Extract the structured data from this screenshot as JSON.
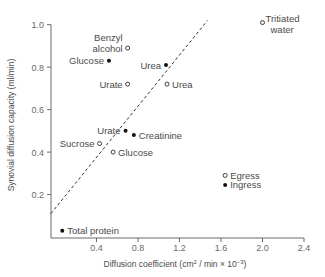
{
  "chart_data": {
    "type": "scatter",
    "title": "",
    "xlabel": "Diffusion coefficient (cm² / min × 10⁻³)",
    "ylabel": "Synovial diffusion capacity (ml/min)",
    "xlim": [
      0,
      2.4
    ],
    "ylim": [
      0,
      1.0
    ],
    "xticks": [
      0.4,
      0.8,
      1.2,
      1.6,
      2.0,
      2.4
    ],
    "xtick_labels": [
      "0.4",
      "0.8",
      "1.2",
      "1.6",
      "2.0",
      "2.4"
    ],
    "yticks": [
      0.2,
      0.4,
      0.6,
      0.8,
      1.0
    ],
    "ytick_labels": [
      "0.2",
      "0.4",
      "0.6",
      "0.8",
      "1.0"
    ],
    "grid": false,
    "legend": null,
    "series": [
      {
        "name": "Filled (solid) markers",
        "marker": "filled-circle",
        "points": [
          {
            "label": "Glucose",
            "x": 0.52,
            "y": 0.83,
            "label_side": "left"
          },
          {
            "label": "Urea",
            "x": 1.07,
            "y": 0.81,
            "label_side": "left"
          },
          {
            "label": "Urate",
            "x": 0.68,
            "y": 0.5,
            "label_side": "left"
          },
          {
            "label": "Creatinine",
            "x": 0.76,
            "y": 0.48,
            "label_side": "right"
          },
          {
            "label": "Ingress",
            "x": 1.64,
            "y": 0.245,
            "label_side": "right"
          },
          {
            "label": "Total protein",
            "x": 0.07,
            "y": 0.03,
            "label_side": "right"
          }
        ]
      },
      {
        "name": "Open (hollow) markers",
        "marker": "open-circle",
        "points": [
          {
            "label": "Benzyl alcohol",
            "label_lines": [
              "Benzyl",
              "alcohol"
            ],
            "x": 0.7,
            "y": 0.89,
            "label_side": "left"
          },
          {
            "label": "Urate",
            "x": 0.7,
            "y": 0.72,
            "label_side": "left"
          },
          {
            "label": "Urea",
            "x": 1.08,
            "y": 0.72,
            "label_side": "right"
          },
          {
            "label": "Sucrose",
            "x": 0.43,
            "y": 0.44,
            "label_side": "left"
          },
          {
            "label": "Glucose",
            "x": 0.56,
            "y": 0.4,
            "label_side": "right"
          },
          {
            "label": "Egress",
            "x": 1.64,
            "y": 0.29,
            "label_side": "right"
          },
          {
            "label": "Tritiated water",
            "label_lines": [
              "Tritiated",
              "water"
            ],
            "x": 2.0,
            "y": 1.01,
            "label_side": "right-top"
          }
        ]
      }
    ],
    "annotations": [
      {
        "type": "dashed-line",
        "x0": -0.04,
        "y0": 0.11,
        "x1": 1.47,
        "y1": 1.02,
        "description": "Linear trend line"
      }
    ]
  },
  "colors": {
    "axis": "#6a6a6a",
    "marker": "#111111",
    "text": "#4a4a4a",
    "trendline": "#333333"
  }
}
